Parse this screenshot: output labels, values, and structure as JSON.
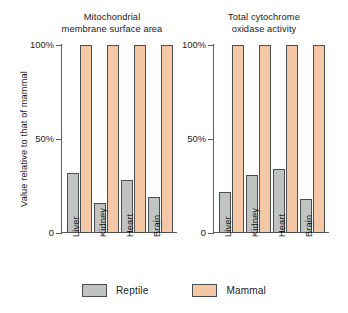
{
  "chart_data": {
    "type": "bar",
    "title": "",
    "ylabel": "Value relative to that of mammal",
    "xlabel": "",
    "ylim": [
      0,
      100
    ],
    "ytick_labels": [
      "0",
      "50%",
      "100%"
    ],
    "ytick_values": [
      0,
      50,
      100
    ],
    "grid": false,
    "legend_position": "bottom",
    "legend": [
      {
        "name": "Reptile",
        "color": "#bfc4c2"
      },
      {
        "name": "Mammal",
        "color": "#f4c8a6"
      }
    ],
    "panels": [
      {
        "title_lines": [
          "Mitochondrial",
          "membrane surface area"
        ],
        "categories": [
          "Liver",
          "Kidney",
          "Heart",
          "Brain"
        ],
        "series": [
          {
            "name": "Reptile",
            "values": [
              32,
              16,
              28,
              19
            ]
          },
          {
            "name": "Mammal",
            "values": [
              100,
              100,
              100,
              100
            ]
          }
        ]
      },
      {
        "title_lines": [
          "Total cytochrome",
          "oxidase activity"
        ],
        "categories": [
          "Liver",
          "Kidney",
          "Heart",
          "Brain"
        ],
        "series": [
          {
            "name": "Reptile",
            "values": [
              22,
              31,
              34,
              18
            ]
          },
          {
            "name": "Mammal",
            "values": [
              100,
              100,
              100,
              100
            ]
          }
        ]
      }
    ]
  }
}
